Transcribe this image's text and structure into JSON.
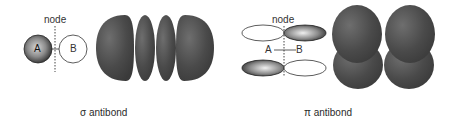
{
  "figure": {
    "panels": [
      {
        "id": "sigma",
        "caption": "σ antibond",
        "schematic": {
          "node_label": "node",
          "atom_a_label": "A",
          "atom_b_label": "B",
          "atom_a_style": "shaded",
          "atom_b_style": "open"
        },
        "rendering": {
          "lobe_count": 4,
          "arrangement": "linear-horizontal"
        }
      },
      {
        "id": "pi",
        "caption": "π antibond",
        "schematic": {
          "node_label": "node",
          "atom_a_label": "A",
          "atom_b_label": "B",
          "top_left_lobe": "open",
          "top_right_lobe": "shaded",
          "bottom_left_lobe": "shaded",
          "bottom_right_lobe": "open"
        },
        "rendering": {
          "lobe_count": 4,
          "arrangement": "2x2"
        }
      }
    ],
    "colors": {
      "lobe_fill": "#4a4a4a",
      "lobe_highlight": "#7a7a7a",
      "outline": "#333333",
      "background": "#ffffff"
    }
  }
}
